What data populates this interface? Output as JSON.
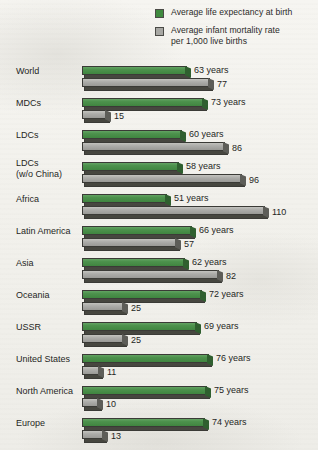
{
  "legend": {
    "items": [
      {
        "icon": "green-square-swatch",
        "color": "#3f8a3f",
        "line1": "Average life expectancy at birth",
        "line2": ""
      },
      {
        "icon": "gray-square-swatch",
        "color": "#a8a8a4",
        "line1": "Average infant mortality rate",
        "line2": "per 1,000 live births"
      }
    ]
  },
  "chart_data": {
    "type": "bar",
    "orientation": "horizontal",
    "title": "",
    "xlabel": "",
    "ylabel": "",
    "grid": false,
    "legend_position": "top-right",
    "xlim": [
      0,
      110
    ],
    "categories": [
      "World",
      "MDCs",
      "LDCs",
      "LDCs\n (w/o China)",
      "Africa",
      "Latin America",
      "Asia",
      "Oceania",
      "USSR",
      "United States",
      "North America",
      "Europe"
    ],
    "series": [
      {
        "name": "Average life expectancy at birth",
        "color": "#3f8a3f",
        "unit": "years",
        "values": [
          63,
          73,
          60,
          58,
          51,
          66,
          62,
          72,
          69,
          76,
          75,
          74
        ],
        "labels": [
          "63 years",
          "73 years",
          "60 years",
          "58 years",
          "51 years",
          "66 years",
          "62 years",
          "72 years",
          "69 years",
          "76 years",
          "75 years",
          "74 years"
        ]
      },
      {
        "name": "Average infant mortality rate per 1,000 live births",
        "color": "#a8a8a4",
        "unit": "",
        "values": [
          77,
          15,
          86,
          96,
          110,
          57,
          82,
          25,
          25,
          11,
          10,
          13
        ],
        "labels": [
          "77",
          "15",
          "86",
          "96",
          "110",
          "57",
          "82",
          "25",
          "25",
          "11",
          "10",
          "13"
        ]
      }
    ]
  }
}
